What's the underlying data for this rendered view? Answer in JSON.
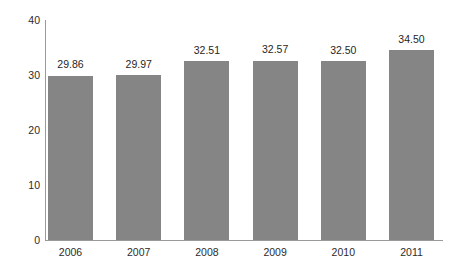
{
  "chart_data": {
    "type": "bar",
    "title": "",
    "subtitle": "",
    "xlabel": "",
    "ylabel": "",
    "categories": [
      "2006",
      "2007",
      "2008",
      "2009",
      "2010",
      "2011"
    ],
    "values": [
      29.86,
      29.97,
      32.51,
      32.57,
      32.5,
      34.5
    ],
    "value_labels": [
      "29.86",
      "29.97",
      "32.51",
      "32.57",
      "32.50",
      "34.50"
    ],
    "ylim": [
      0,
      40
    ],
    "yticks": [
      0,
      10,
      20,
      30,
      40
    ],
    "ytick_labels": [
      "0",
      "10",
      "20",
      "30",
      "40"
    ],
    "grid": false,
    "legend": false,
    "legend_position": "none",
    "bar_color": "#858585",
    "axis_color": "#9a9a9a",
    "text_color": "#2b2b2b",
    "background": "#ffffff"
  }
}
